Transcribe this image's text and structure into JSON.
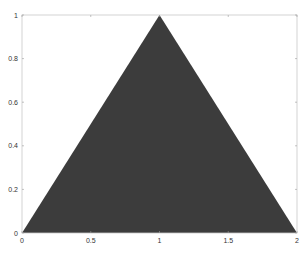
{
  "chart_data": {
    "type": "area",
    "title": "",
    "xlabel": "",
    "ylabel": "",
    "xlim": [
      0,
      2
    ],
    "ylim": [
      0,
      1
    ],
    "grid": false,
    "legend": null,
    "x_ticks": [
      0,
      0.5,
      1,
      1.5,
      2
    ],
    "x_tick_labels": [
      "0",
      "0.5",
      "1",
      "1.5",
      "2"
    ],
    "y_ticks": [
      0,
      0.2,
      0.4,
      0.6,
      0.8,
      1
    ],
    "y_tick_labels": [
      "0",
      "0.2",
      "0.4",
      "0.6",
      "0.8",
      "1"
    ],
    "series": [
      {
        "name": "filled triangle",
        "x": [
          0,
          1,
          2
        ],
        "y": [
          0,
          1,
          0
        ],
        "color": "#3c3c3c"
      }
    ]
  },
  "colors": {
    "fill": "#3c3c3c",
    "axes": "#c8c8c8",
    "tick_label": "#333333"
  }
}
